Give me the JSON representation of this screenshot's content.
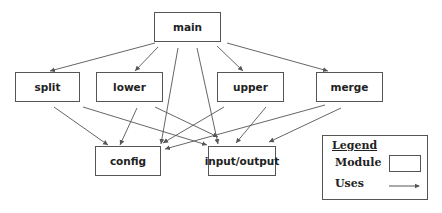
{
  "diagram": {
    "type": "module-uses-graph",
    "colors": {
      "line": "#555555",
      "border": "#555555",
      "text": "#222222"
    },
    "modules": [
      {
        "id": "main",
        "label": "main",
        "x": 154,
        "y": 12,
        "w": 67,
        "h": 30
      },
      {
        "id": "split",
        "label": "split",
        "x": 15,
        "y": 72,
        "w": 65,
        "h": 30
      },
      {
        "id": "lower",
        "label": "lower",
        "x": 96,
        "y": 72,
        "w": 67,
        "h": 30
      },
      {
        "id": "upper",
        "label": "upper",
        "x": 217,
        "y": 72,
        "w": 67,
        "h": 30
      },
      {
        "id": "merge",
        "label": "merge",
        "x": 316,
        "y": 72,
        "w": 67,
        "h": 30
      },
      {
        "id": "config",
        "label": "config",
        "x": 95,
        "y": 146,
        "w": 66,
        "h": 30
      },
      {
        "id": "io",
        "label": "input/output",
        "x": 208,
        "y": 146,
        "w": 68,
        "h": 30
      }
    ],
    "edges": [
      {
        "from": "main",
        "to": "split",
        "x1": 155,
        "y1": 43,
        "x2": 50,
        "y2": 71
      },
      {
        "from": "main",
        "to": "lower",
        "x1": 158,
        "y1": 47,
        "x2": 135,
        "y2": 71
      },
      {
        "from": "main",
        "to": "config",
        "x1": 178,
        "y1": 48,
        "x2": 161,
        "y2": 144
      },
      {
        "from": "main",
        "to": "io",
        "x1": 197,
        "y1": 48,
        "x2": 218,
        "y2": 144
      },
      {
        "from": "main",
        "to": "upper",
        "x1": 217,
        "y1": 46,
        "x2": 243,
        "y2": 71
      },
      {
        "from": "main",
        "to": "merge",
        "x1": 227,
        "y1": 43,
        "x2": 328,
        "y2": 71
      },
      {
        "from": "split",
        "to": "config",
        "x1": 54,
        "y1": 107,
        "x2": 108,
        "y2": 145
      },
      {
        "from": "split",
        "to": "io",
        "x1": 83,
        "y1": 107,
        "x2": 207,
        "y2": 145
      },
      {
        "from": "lower",
        "to": "config",
        "x1": 137,
        "y1": 108,
        "x2": 120,
        "y2": 145
      },
      {
        "from": "lower",
        "to": "io",
        "x1": 155,
        "y1": 107,
        "x2": 218,
        "y2": 137
      },
      {
        "from": "upper",
        "to": "config",
        "x1": 224,
        "y1": 107,
        "x2": 163,
        "y2": 143
      },
      {
        "from": "upper",
        "to": "io",
        "x1": 266,
        "y1": 107,
        "x2": 236,
        "y2": 143
      },
      {
        "from": "merge",
        "to": "config",
        "x1": 325,
        "y1": 105,
        "x2": 165,
        "y2": 149
      },
      {
        "from": "merge",
        "to": "io",
        "x1": 341,
        "y1": 108,
        "x2": 269,
        "y2": 142
      }
    ]
  },
  "legend": {
    "title": "Legend",
    "module_label": "Module",
    "uses_label": "Uses"
  }
}
